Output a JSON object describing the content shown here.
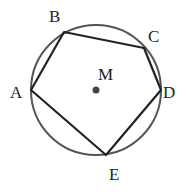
{
  "diagram": {
    "type": "inscribed-pentagon",
    "circle": {
      "cx": 96,
      "cy": 90,
      "r": 65,
      "stroke": "#555555"
    },
    "center": {
      "label": "M",
      "x": 96,
      "y": 90,
      "dot_color": "#444444"
    },
    "polygon_stroke": "#222222",
    "vertices": [
      {
        "label": "A",
        "x": 31,
        "y": 90,
        "lx": 10,
        "ly": 98
      },
      {
        "label": "B",
        "x": 64,
        "y": 32,
        "lx": 49,
        "ly": 22
      },
      {
        "label": "C",
        "x": 144,
        "y": 48,
        "lx": 148,
        "ly": 42
      },
      {
        "label": "D",
        "x": 161,
        "y": 90,
        "lx": 163,
        "ly": 98
      },
      {
        "label": "E",
        "x": 106,
        "y": 155,
        "lx": 109,
        "ly": 180
      }
    ]
  }
}
